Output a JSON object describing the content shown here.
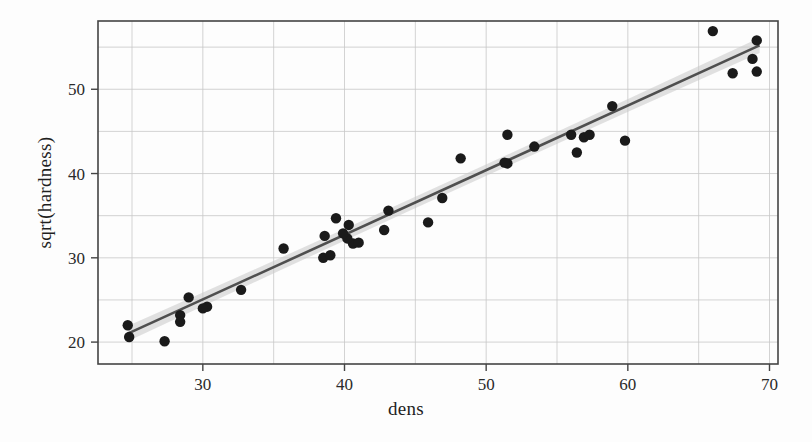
{
  "chart_data": {
    "type": "scatter",
    "title": "",
    "xlabel": "dens",
    "ylabel": "sqrt(hardness)",
    "xlim": [
      22.6,
      70.6
    ],
    "ylim": [
      17.4,
      58.1
    ],
    "xticks": [
      30,
      40,
      50,
      60,
      70
    ],
    "xtick_labels": [
      "30",
      "40",
      "50",
      "60",
      "70"
    ],
    "yticks": [
      20,
      30,
      40,
      50
    ],
    "ytick_labels": [
      "20",
      "30",
      "40",
      "50"
    ],
    "x_minor_gridlines": [
      25,
      30,
      35,
      40,
      45,
      50,
      55,
      60,
      65,
      70
    ],
    "y_minor_gridlines": [
      20,
      25,
      30,
      35,
      40,
      45,
      50,
      55
    ],
    "grid": true,
    "legend": "none",
    "point_color": "#1a1a1a",
    "point_radius": 5.2,
    "line_color": "#4f4f4f",
    "band_color": "#c9c9c9",
    "grid_color": "#c8c8c8",
    "frame_color": "#444444",
    "points": [
      {
        "x": 24.7,
        "y": 22.0
      },
      {
        "x": 24.8,
        "y": 20.6
      },
      {
        "x": 27.3,
        "y": 20.1
      },
      {
        "x": 28.4,
        "y": 23.2
      },
      {
        "x": 28.4,
        "y": 22.4
      },
      {
        "x": 29.0,
        "y": 25.3
      },
      {
        "x": 30.3,
        "y": 24.2
      },
      {
        "x": 30.0,
        "y": 24.0
      },
      {
        "x": 32.7,
        "y": 26.2
      },
      {
        "x": 35.7,
        "y": 31.1
      },
      {
        "x": 38.5,
        "y": 30.0
      },
      {
        "x": 38.6,
        "y": 32.6
      },
      {
        "x": 39.4,
        "y": 34.7
      },
      {
        "x": 39.0,
        "y": 30.3
      },
      {
        "x": 40.3,
        "y": 33.9
      },
      {
        "x": 40.6,
        "y": 31.7
      },
      {
        "x": 41.0,
        "y": 31.8
      },
      {
        "x": 40.2,
        "y": 32.3
      },
      {
        "x": 39.9,
        "y": 32.9
      },
      {
        "x": 42.8,
        "y": 33.3
      },
      {
        "x": 43.1,
        "y": 35.6
      },
      {
        "x": 45.9,
        "y": 34.2
      },
      {
        "x": 46.9,
        "y": 37.1
      },
      {
        "x": 48.2,
        "y": 41.8
      },
      {
        "x": 51.5,
        "y": 44.6
      },
      {
        "x": 51.5,
        "y": 41.2
      },
      {
        "x": 51.3,
        "y": 41.3
      },
      {
        "x": 53.4,
        "y": 43.2
      },
      {
        "x": 56.0,
        "y": 44.6
      },
      {
        "x": 56.4,
        "y": 42.5
      },
      {
        "x": 56.9,
        "y": 44.3
      },
      {
        "x": 57.3,
        "y": 44.6
      },
      {
        "x": 58.9,
        "y": 48.0
      },
      {
        "x": 59.8,
        "y": 43.9
      },
      {
        "x": 66.0,
        "y": 56.9
      },
      {
        "x": 67.4,
        "y": 51.9
      },
      {
        "x": 69.1,
        "y": 55.8
      },
      {
        "x": 68.8,
        "y": 53.6
      },
      {
        "x": 69.1,
        "y": 52.1
      }
    ],
    "fit_line": {
      "x_start": 24.7,
      "y_start": 21.0,
      "x_end": 69.3,
      "y_end": 55.2,
      "band_halfwidth_start": 0.9,
      "band_halfwidth_mid": 0.45,
      "band_halfwidth_end": 0.9
    }
  }
}
